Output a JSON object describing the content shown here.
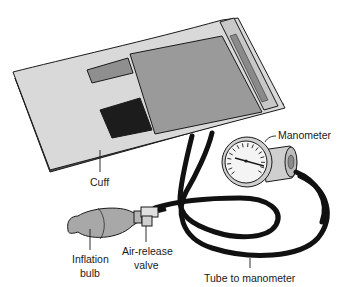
{
  "diagram": {
    "labels": {
      "cuff": "Cuff",
      "manometer": "Manometer",
      "inflation_bulb_line1": "Inflation",
      "inflation_bulb_line2": "bulb",
      "air_release_valve_line1": "Air-release",
      "air_release_valve_line2": "valve",
      "tube": "Tube to manometer"
    },
    "colors": {
      "cuff_fabric": "#d9d9d9",
      "cuff_panel": "#9a9a9a",
      "velcro_dark": "#1c1c1c",
      "tube": "#111111",
      "bulb": "#a8a8a8",
      "gauge_face": "#f4f4f4"
    }
  }
}
